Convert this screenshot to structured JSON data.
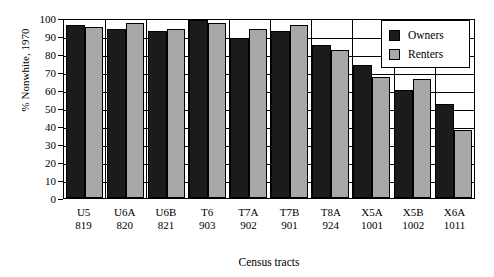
{
  "chart_data": {
    "type": "bar",
    "title": "",
    "xlabel": "Census tracts",
    "ylabel": "% Nonwhite, 1970",
    "ylim": [
      0,
      100
    ],
    "ytick_step": 10,
    "yticks": [
      0,
      10,
      20,
      30,
      40,
      50,
      60,
      70,
      80,
      90,
      100
    ],
    "grid": true,
    "legend_position": "top-right",
    "categories": [
      "U5",
      "U6A",
      "U6B",
      "T6",
      "T7A",
      "T7B",
      "T8A",
      "X5A",
      "X5B",
      "X6A"
    ],
    "category_numbers": [
      "819",
      "820",
      "821",
      "903",
      "902",
      "901",
      "924",
      "1001",
      "1002",
      "1011"
    ],
    "series": [
      {
        "name": "Owners",
        "color": "#1b1b1b",
        "values": [
          96,
          94,
          93,
          99,
          89,
          93,
          85,
          74,
          60,
          52
        ]
      },
      {
        "name": "Renters",
        "color": "#a8a8a8",
        "values": [
          95,
          97,
          94,
          97,
          94,
          96,
          82,
          67,
          66,
          38
        ]
      }
    ]
  }
}
